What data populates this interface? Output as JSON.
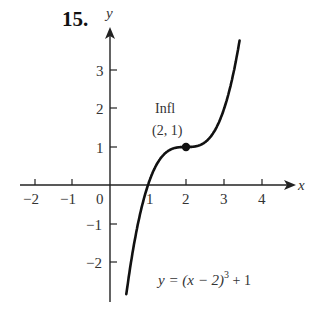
{
  "problem_number": "15.",
  "axes": {
    "x_label": "x",
    "y_label": "y",
    "x_ticks": [
      "−2",
      "−1",
      "0",
      "1",
      "2",
      "3",
      "4"
    ],
    "y_ticks": [
      "3",
      "2",
      "1",
      "−1",
      "−2"
    ]
  },
  "annotation": {
    "line1": "Infl",
    "line2": "(2, 1)"
  },
  "equation": {
    "lhs": "y = (x − 2)",
    "exponent": "3",
    "rhs": " + 1"
  },
  "chart_data": {
    "type": "line",
    "title": "15.",
    "xlabel": "x",
    "ylabel": "y",
    "xlim": [
      -2.4,
      4.8
    ],
    "ylim": [
      -3.1,
      4.1
    ],
    "function": "y = (x - 2)^3 + 1",
    "x": [
      0.45,
      0.6,
      0.8,
      1.0,
      1.2,
      1.4,
      1.6,
      1.8,
      2.0,
      2.2,
      2.4,
      2.6,
      2.8,
      3.0,
      3.2,
      3.4
    ],
    "y": [
      -2.72,
      -1.74,
      -0.73,
      0.0,
      0.49,
      0.78,
      0.94,
      0.99,
      1.0,
      1.01,
      1.06,
      1.22,
      1.51,
      2.0,
      2.73,
      3.74
    ],
    "points": [
      {
        "x": 2,
        "y": 1,
        "label": "Infl (2, 1)"
      }
    ],
    "x_ticks": [
      -2,
      -1,
      0,
      1,
      2,
      3,
      4
    ],
    "y_ticks": [
      -2,
      -1,
      1,
      2,
      3
    ],
    "grid": false,
    "annotations": [
      "Infl (2, 1)",
      "y = (x − 2)^3 + 1"
    ]
  }
}
